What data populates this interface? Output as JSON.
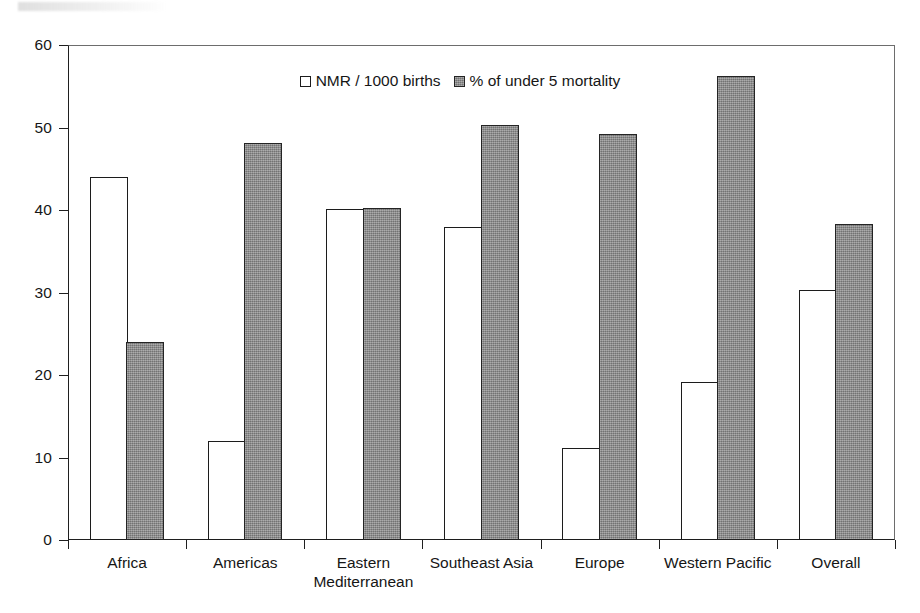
{
  "chart_data": {
    "type": "bar",
    "title": "",
    "subtitle": "",
    "xlabel": "",
    "ylabel": "",
    "ylim": [
      0,
      60
    ],
    "yticks": [
      0,
      10,
      20,
      30,
      40,
      50,
      60
    ],
    "ytick_labels": [
      "0",
      "10",
      "20",
      "30",
      "40",
      "50",
      "60"
    ],
    "grid": false,
    "legend_position": "top-center",
    "categories": [
      "Africa",
      "Americas",
      "Eastern Mediterranean",
      "Southeast Asia",
      "Europe",
      "Western Pacific",
      "Overall"
    ],
    "category_lines": [
      [
        "Africa"
      ],
      [
        "Americas"
      ],
      [
        "Eastern",
        "Mediterranean"
      ],
      [
        "Southeast Asia"
      ],
      [
        "Europe"
      ],
      [
        "Western Pacific"
      ],
      [
        "Overall"
      ]
    ],
    "series": [
      {
        "name": "NMR / 1000 births",
        "color": "#ffffff",
        "edge_color": "#1c1c1c",
        "values": [
          44.0,
          12.0,
          40.1,
          38.0,
          11.2,
          19.2,
          30.3
        ]
      },
      {
        "name": "% of under 5 mortality",
        "color": "#8d8d8d",
        "edge_color": "#242424",
        "values": [
          24.0,
          48.1,
          40.2,
          50.3,
          49.2,
          56.3,
          38.3
        ]
      }
    ]
  },
  "legend": {
    "entries": [
      {
        "label": "NMR / 1000 births",
        "swatch": "white-square-swatch"
      },
      {
        "label": "% of under 5 mortality",
        "swatch": "gray-square-swatch"
      }
    ]
  },
  "axes": {
    "y": {
      "min": 0,
      "max": 60,
      "tick_labels": [
        "60",
        "50",
        "40",
        "30",
        "20",
        "10",
        "0"
      ],
      "tick_values": [
        60,
        50,
        40,
        30,
        20,
        10,
        0
      ]
    }
  },
  "colors": {
    "series_nmr_fill": "#ffffff",
    "series_mortality_fill": "#8d8d8d",
    "bar_outline": "#1c1c1c",
    "axis": "#1f1f1f",
    "frame": "#6d6d6d",
    "text": "#161616",
    "background": "#ffffff"
  }
}
